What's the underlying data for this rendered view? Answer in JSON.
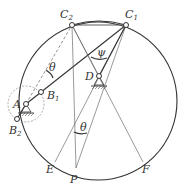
{
  "diagram": {
    "type": "crank-rocker mechanism construction",
    "points": {
      "C1": {
        "label": "C",
        "sub": "1"
      },
      "C2": {
        "label": "C",
        "sub": "2"
      },
      "D": {
        "label": "D",
        "sub": ""
      },
      "A": {
        "label": "A",
        "sub": ""
      },
      "B1": {
        "label": "B",
        "sub": "1"
      },
      "B2": {
        "label": "B",
        "sub": "2"
      },
      "E": {
        "label": "E",
        "sub": ""
      },
      "P": {
        "label": "P",
        "sub": ""
      },
      "F": {
        "label": "F",
        "sub": ""
      }
    },
    "angles": {
      "theta_top": "θ",
      "psi": "ψ",
      "theta_bottom": "θ"
    },
    "colors": {
      "line": "#333333",
      "thin": "#555555",
      "background": "#ffffff"
    }
  }
}
